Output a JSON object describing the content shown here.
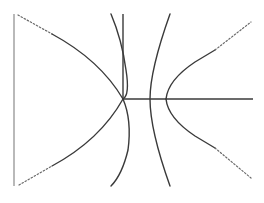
{
  "diagram": {
    "colors": {
      "line": "#3a3a3a",
      "thin_line": "#8a8a8a",
      "dotted": "#6a6a6a",
      "background": "#ffffff"
    },
    "elements": {
      "left_boundary": {
        "x": 14,
        "y1": 14,
        "y2": 186
      },
      "horizontal_ray": {
        "y": 99,
        "x1": 123,
        "x2": 253
      },
      "crossing_point": {
        "x": 123,
        "y": 99
      },
      "right_vertex_x": 166
    }
  }
}
